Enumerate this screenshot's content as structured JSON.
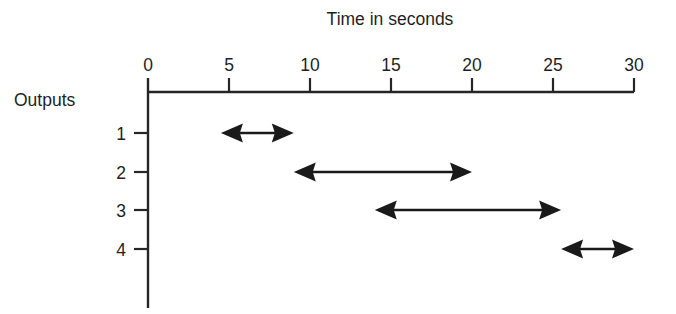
{
  "chart_data": {
    "type": "bar",
    "title": "Time in seconds",
    "xlabel": "Time in seconds",
    "ylabel": "Outputs",
    "xlim": [
      0,
      30
    ],
    "x_ticks": [
      0,
      5,
      10,
      15,
      20,
      25,
      30
    ],
    "x_tick_labels": [
      "0",
      "5",
      "10",
      "15",
      "20",
      "25",
      "30"
    ],
    "categories": [
      "1",
      "2",
      "3",
      "4"
    ],
    "grid": false,
    "legend": null,
    "orientation": "horizontal",
    "style": "double-headed arrow range bars (Gantt-like timing diagram)",
    "series": [
      {
        "name": "Outputs",
        "bars": [
          {
            "category": "1",
            "start": 4.5,
            "end": 9.0,
            "duration": 4.5
          },
          {
            "category": "2",
            "start": 9.0,
            "end": 20.0,
            "duration": 11.0
          },
          {
            "category": "3",
            "start": 14.0,
            "end": 25.5,
            "duration": 11.5
          },
          {
            "category": "4",
            "start": 25.5,
            "end": 30.0,
            "duration": 4.5
          }
        ]
      }
    ],
    "colors": {
      "axis": "#262626",
      "arrow": "#1a1a1a",
      "background": "#ffffff",
      "text": "#1f1f1f"
    }
  },
  "labels": {
    "title": "Time in seconds",
    "y_axis_name": "Outputs",
    "row_1": "1",
    "row_2": "2",
    "row_3": "3",
    "row_4": "4",
    "tick_0": "0",
    "tick_5": "5",
    "tick_10": "10",
    "tick_15": "15",
    "tick_20": "20",
    "tick_25": "25",
    "tick_30": "30"
  }
}
